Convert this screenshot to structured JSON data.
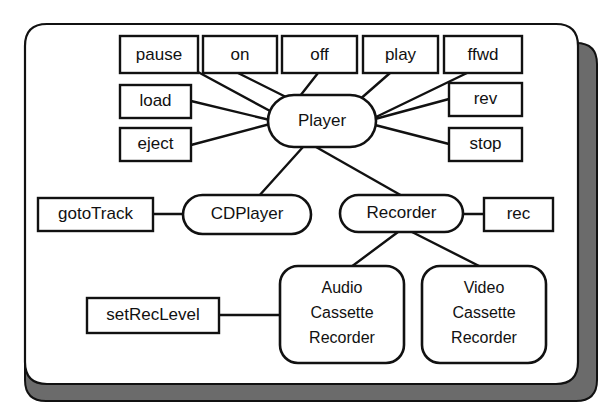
{
  "diagram": {
    "frame": {
      "fill_color": "#ffffff",
      "stroke_color": "#111111",
      "shadow_color": "#6b6b6b"
    },
    "classes": [
      {
        "id": "player",
        "label": "Player",
        "shape": "rounded-rect",
        "x": 268,
        "y": 95,
        "w": 108,
        "h": 52
      },
      {
        "id": "cdplayer",
        "label": "CDPlayer",
        "shape": "rounded-rect",
        "x": 183,
        "y": 195,
        "w": 128,
        "h": 39
      },
      {
        "id": "recorder",
        "label": "Recorder",
        "shape": "rounded-rect",
        "x": 340,
        "y": 195,
        "w": 123,
        "h": 37
      },
      {
        "id": "audio-cassette-recorder",
        "label": "Audio Cassette Recorder",
        "lines": [
          "Audio",
          "Cassette",
          "Recorder"
        ],
        "shape": "rounded-rect",
        "x": 280,
        "y": 266,
        "w": 124,
        "h": 97
      },
      {
        "id": "video-cassette-recorder",
        "label": "Video Cassette Recorder",
        "lines": [
          "Video",
          "Cassette",
          "Recorder"
        ],
        "shape": "rounded-rect",
        "x": 422,
        "y": 266,
        "w": 124,
        "h": 97
      }
    ],
    "operations": [
      {
        "id": "pause",
        "label": "pause",
        "owner": "player",
        "x": 120,
        "y": 36,
        "w": 78,
        "h": 37
      },
      {
        "id": "on",
        "label": "on",
        "owner": "player",
        "x": 203,
        "y": 36,
        "w": 74,
        "h": 37
      },
      {
        "id": "off",
        "label": "off",
        "owner": "player",
        "x": 282,
        "y": 36,
        "w": 75,
        "h": 37
      },
      {
        "id": "play",
        "label": "play",
        "owner": "player",
        "x": 363,
        "y": 36,
        "w": 75,
        "h": 37
      },
      {
        "id": "ffwd",
        "label": "ffwd",
        "owner": "player",
        "x": 444,
        "y": 36,
        "w": 78,
        "h": 37
      },
      {
        "id": "load",
        "label": "load",
        "owner": "player",
        "x": 120,
        "y": 85,
        "w": 71,
        "h": 33
      },
      {
        "id": "eject",
        "label": "eject",
        "owner": "player",
        "x": 120,
        "y": 128,
        "w": 71,
        "h": 33
      },
      {
        "id": "rev",
        "label": "rev",
        "owner": "player",
        "x": 449,
        "y": 83,
        "w": 73,
        "h": 33
      },
      {
        "id": "stop",
        "label": "stop",
        "owner": "player",
        "x": 449,
        "y": 128,
        "w": 73,
        "h": 33
      },
      {
        "id": "gototrack",
        "label": "gotoTrack",
        "owner": "cdplayer",
        "x": 38,
        "y": 198,
        "w": 115,
        "h": 33
      },
      {
        "id": "rec",
        "label": "rec",
        "owner": "recorder",
        "x": 484,
        "y": 198,
        "w": 69,
        "h": 33
      },
      {
        "id": "setreclevel",
        "label": "setRecLevel",
        "owner": "audio-cassette-recorder",
        "x": 87,
        "y": 298,
        "w": 132,
        "h": 35
      }
    ],
    "links": [
      {
        "id": "pause-player",
        "from": "pause",
        "to": "player",
        "type": "operation"
      },
      {
        "id": "on-player",
        "from": "on",
        "to": "player",
        "type": "operation"
      },
      {
        "id": "off-player",
        "from": "off",
        "to": "player",
        "type": "operation"
      },
      {
        "id": "play-player",
        "from": "play",
        "to": "player",
        "type": "operation"
      },
      {
        "id": "ffwd-player",
        "from": "ffwd",
        "to": "player",
        "type": "operation"
      },
      {
        "id": "load-player",
        "from": "load",
        "to": "player",
        "type": "operation"
      },
      {
        "id": "eject-player",
        "from": "eject",
        "to": "player",
        "type": "operation"
      },
      {
        "id": "rev-player",
        "from": "rev",
        "to": "player",
        "type": "operation"
      },
      {
        "id": "stop-player",
        "from": "stop",
        "to": "player",
        "type": "operation"
      },
      {
        "id": "player-cdplayer",
        "from": "player",
        "to": "cdplayer",
        "type": "inheritance"
      },
      {
        "id": "player-recorder",
        "from": "player",
        "to": "recorder",
        "type": "inheritance"
      },
      {
        "id": "gototrack-cdplayer",
        "from": "gototrack",
        "to": "cdplayer",
        "type": "operation"
      },
      {
        "id": "rec-recorder",
        "from": "rec",
        "to": "recorder",
        "type": "operation"
      },
      {
        "id": "recorder-audio",
        "from": "recorder",
        "to": "audio-cassette-recorder",
        "type": "inheritance"
      },
      {
        "id": "recorder-video",
        "from": "recorder",
        "to": "video-cassette-recorder",
        "type": "inheritance"
      },
      {
        "id": "setreclevel-audio",
        "from": "setreclevel",
        "to": "audio-cassette-recorder",
        "type": "operation"
      }
    ]
  }
}
